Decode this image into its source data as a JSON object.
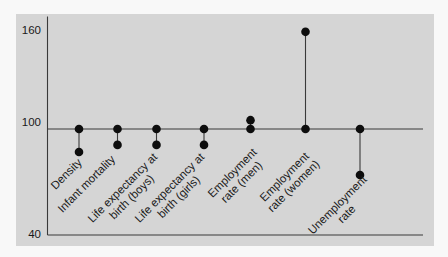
{
  "chart_data": {
    "type": "dot-stem",
    "title": "",
    "xlabel": "",
    "ylabel": "",
    "ylim": [
      40,
      160
    ],
    "yticks": [
      40,
      100,
      160
    ],
    "baseline": 100,
    "grid": false,
    "legend": null,
    "categories": [
      "Density",
      "Infant mortality",
      "Life expectancy at birth (boys)",
      "Life expectancy at birth (girls)",
      "Employment rate (men)",
      "Employment rate (women)",
      "Unemployment rate"
    ],
    "category_label_lines": [
      [
        "Density"
      ],
      [
        "Infant mortality"
      ],
      [
        "Life expectancy at",
        "birth (boys)"
      ],
      [
        "Life expectancy at",
        "birth (girls)"
      ],
      [
        "Employment",
        "rate (men)"
      ],
      [
        "Employment",
        "rate (women)"
      ],
      [
        "Unemployment",
        "rate"
      ]
    ],
    "series": [
      {
        "name": "Reference (index = 100)",
        "values": [
          100,
          100,
          100,
          100,
          100,
          100,
          100
        ]
      },
      {
        "name": "Value",
        "values": [
          87,
          91,
          91,
          91,
          105,
          155,
          74
        ]
      }
    ]
  },
  "colors": {
    "page_bg": "#f8f8f8",
    "panel_bg": "#d5d5d5",
    "axis": "#3a3a3a",
    "marker": "#0d0d0d",
    "text": "#1a1a1a"
  }
}
